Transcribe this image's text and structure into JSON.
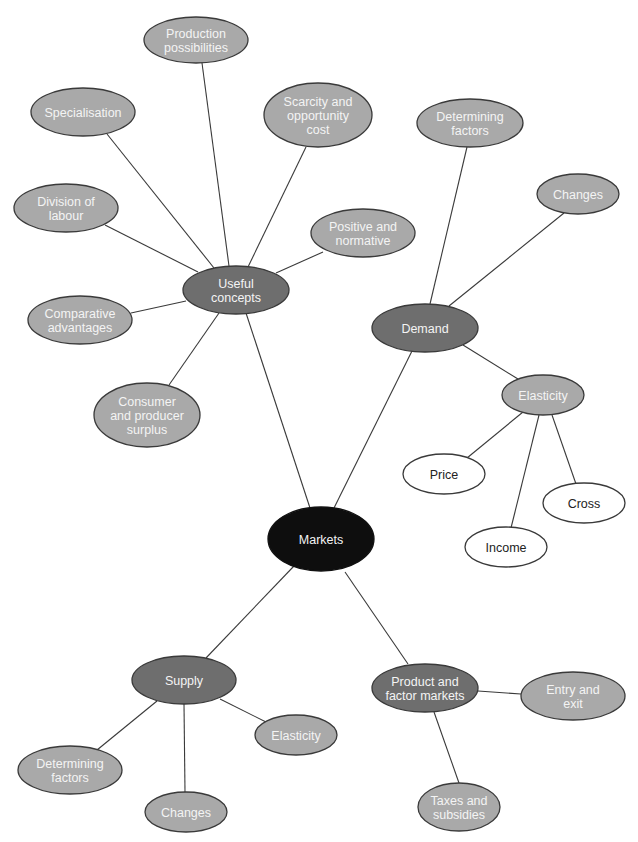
{
  "colors": {
    "root": "#0e0e0e",
    "hub": "#6e6e6e",
    "leaf": "#a9a9a9",
    "white": "#ffffff",
    "line": "#3a3a3a"
  },
  "nodes": [
    {
      "id": "markets",
      "lines": [
        "Markets"
      ],
      "level": "root",
      "cx": 321,
      "cy": 539,
      "rx": 53,
      "ry": 32
    },
    {
      "id": "useful-concepts",
      "lines": [
        "Useful",
        "concepts"
      ],
      "level": "hub",
      "cx": 236,
      "cy": 290,
      "rx": 53,
      "ry": 24
    },
    {
      "id": "demand",
      "lines": [
        "Demand"
      ],
      "level": "hub",
      "cx": 425,
      "cy": 328,
      "rx": 53,
      "ry": 24
    },
    {
      "id": "supply",
      "lines": [
        "Supply"
      ],
      "level": "hub",
      "cx": 184,
      "cy": 680,
      "rx": 52,
      "ry": 24
    },
    {
      "id": "product-factor-markets",
      "lines": [
        "Product and",
        "factor markets"
      ],
      "level": "hub",
      "cx": 425,
      "cy": 688,
      "rx": 53,
      "ry": 24
    },
    {
      "id": "production-possibilities",
      "lines": [
        "Production",
        "possibilities"
      ],
      "level": "leaf",
      "cx": 196,
      "cy": 40,
      "rx": 52,
      "ry": 23
    },
    {
      "id": "specialisation",
      "lines": [
        "Specialisation"
      ],
      "level": "leaf",
      "cx": 83,
      "cy": 112,
      "rx": 52,
      "ry": 24
    },
    {
      "id": "scarcity-opportunity-cost",
      "lines": [
        "Scarcity and",
        "opportunity",
        "cost"
      ],
      "level": "leaf",
      "cx": 318,
      "cy": 115,
      "rx": 54,
      "ry": 32
    },
    {
      "id": "division-of-labour",
      "lines": [
        "Division of",
        "labour"
      ],
      "level": "leaf",
      "cx": 66,
      "cy": 208,
      "rx": 52,
      "ry": 24
    },
    {
      "id": "positive-normative",
      "lines": [
        "Positive and",
        "normative"
      ],
      "level": "leaf",
      "cx": 363,
      "cy": 233,
      "rx": 52,
      "ry": 24
    },
    {
      "id": "comparative-advantages",
      "lines": [
        "Comparative",
        "advantages"
      ],
      "level": "leaf",
      "cx": 80,
      "cy": 320,
      "rx": 52,
      "ry": 24
    },
    {
      "id": "consumer-producer-surplus",
      "lines": [
        "Consumer",
        "and producer",
        "surplus"
      ],
      "level": "leaf",
      "cx": 147,
      "cy": 415,
      "rx": 53,
      "ry": 32
    },
    {
      "id": "demand-determining-factors",
      "lines": [
        "Determining",
        "factors"
      ],
      "level": "leaf",
      "cx": 470,
      "cy": 123,
      "rx": 53,
      "ry": 24
    },
    {
      "id": "demand-changes",
      "lines": [
        "Changes"
      ],
      "level": "leaf",
      "cx": 578,
      "cy": 194,
      "rx": 41,
      "ry": 20
    },
    {
      "id": "demand-elasticity",
      "lines": [
        "Elasticity"
      ],
      "level": "sub",
      "cx": 543,
      "cy": 395,
      "rx": 41,
      "ry": 20
    },
    {
      "id": "price",
      "lines": [
        "Price"
      ],
      "level": "white",
      "cx": 444,
      "cy": 474,
      "rx": 41,
      "ry": 20
    },
    {
      "id": "cross",
      "lines": [
        "Cross"
      ],
      "level": "white",
      "cx": 584,
      "cy": 503,
      "rx": 41,
      "ry": 20
    },
    {
      "id": "income",
      "lines": [
        "Income"
      ],
      "level": "white",
      "cx": 506,
      "cy": 547,
      "rx": 41,
      "ry": 20
    },
    {
      "id": "supply-determining-factors",
      "lines": [
        "Determining",
        "factors"
      ],
      "level": "leaf",
      "cx": 70,
      "cy": 770,
      "rx": 52,
      "ry": 24
    },
    {
      "id": "supply-changes",
      "lines": [
        "Changes"
      ],
      "level": "leaf",
      "cx": 186,
      "cy": 812,
      "rx": 41,
      "ry": 20
    },
    {
      "id": "supply-elasticity",
      "lines": [
        "Elasticity"
      ],
      "level": "leaf",
      "cx": 296,
      "cy": 735,
      "rx": 41,
      "ry": 20
    },
    {
      "id": "entry-exit",
      "lines": [
        "Entry and",
        "exit"
      ],
      "level": "leaf",
      "cx": 573,
      "cy": 696,
      "rx": 52,
      "ry": 24
    },
    {
      "id": "taxes-subsidies",
      "lines": [
        "Taxes and",
        "subsidies"
      ],
      "level": "leaf",
      "cx": 459,
      "cy": 807,
      "rx": 41,
      "ry": 24
    }
  ],
  "links": [
    {
      "from": "markets",
      "to": "useful-concepts",
      "x1": 310,
      "y1": 508,
      "x2": 246,
      "y2": 313
    },
    {
      "from": "markets",
      "to": "demand",
      "x1": 334,
      "y1": 508,
      "x2": 412,
      "y2": 351
    },
    {
      "from": "markets",
      "to": "supply",
      "x1": 294,
      "y1": 566,
      "x2": 206,
      "y2": 658
    },
    {
      "from": "markets",
      "to": "product-factor-markets",
      "x1": 345,
      "y1": 572,
      "x2": 408,
      "y2": 664
    },
    {
      "from": "useful-concepts",
      "to": "production-possibilities",
      "x1": 229,
      "y1": 266,
      "x2": 202,
      "y2": 63
    },
    {
      "from": "useful-concepts",
      "to": "specialisation",
      "x1": 214,
      "y1": 268,
      "x2": 107,
      "y2": 134
    },
    {
      "from": "useful-concepts",
      "to": "scarcity-opportunity-cost",
      "x1": 248,
      "y1": 267,
      "x2": 306,
      "y2": 147
    },
    {
      "from": "useful-concepts",
      "to": "division-of-labour",
      "x1": 198,
      "y1": 272,
      "x2": 105,
      "y2": 225
    },
    {
      "from": "useful-concepts",
      "to": "positive-normative",
      "x1": 276,
      "y1": 273,
      "x2": 323,
      "y2": 252
    },
    {
      "from": "useful-concepts",
      "to": "comparative-advantages",
      "x1": 186,
      "y1": 301,
      "x2": 131,
      "y2": 313
    },
    {
      "from": "useful-concepts",
      "to": "consumer-producer-surplus",
      "x1": 219,
      "y1": 313,
      "x2": 169,
      "y2": 385
    },
    {
      "from": "demand",
      "to": "demand-determining-factors",
      "x1": 430,
      "y1": 304,
      "x2": 467,
      "y2": 147
    },
    {
      "from": "demand",
      "to": "demand-changes",
      "x1": 449,
      "y1": 306,
      "x2": 564,
      "y2": 213
    },
    {
      "from": "demand",
      "to": "demand-elasticity",
      "x1": 463,
      "y1": 345,
      "x2": 518,
      "y2": 379
    },
    {
      "from": "demand-elasticity",
      "to": "price",
      "x1": 523,
      "y1": 412,
      "x2": 467,
      "y2": 458
    },
    {
      "from": "demand-elasticity",
      "to": "cross",
      "x1": 552,
      "y1": 415,
      "x2": 576,
      "y2": 484
    },
    {
      "from": "demand-elasticity",
      "to": "income",
      "x1": 539,
      "y1": 415,
      "x2": 511,
      "y2": 528
    },
    {
      "from": "supply",
      "to": "supply-determining-factors",
      "x1": 157,
      "y1": 701,
      "x2": 97,
      "y2": 750
    },
    {
      "from": "supply",
      "to": "supply-changes",
      "x1": 184,
      "y1": 704,
      "x2": 185,
      "y2": 792
    },
    {
      "from": "supply",
      "to": "supply-elasticity",
      "x1": 220,
      "y1": 699,
      "x2": 266,
      "y2": 722
    },
    {
      "from": "product-factor-markets",
      "to": "entry-exit",
      "x1": 478,
      "y1": 691,
      "x2": 521,
      "y2": 694
    },
    {
      "from": "product-factor-markets",
      "to": "taxes-subsidies",
      "x1": 434,
      "y1": 712,
      "x2": 459,
      "y2": 783
    }
  ]
}
